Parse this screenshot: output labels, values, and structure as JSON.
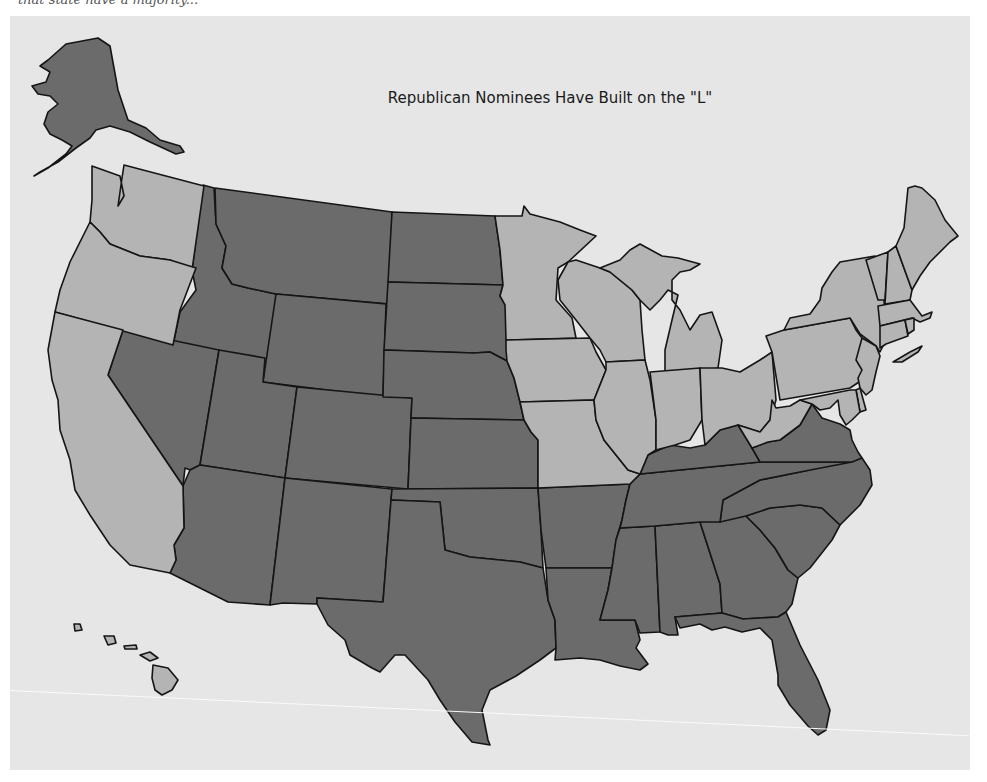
{
  "page": {
    "top_text": "that state have a majority..."
  },
  "map": {
    "title": "Republican Nominees Have Built on the \"L\"",
    "colors": {
      "background": "#e6e6e6",
      "republican_states": "#6b6b6b",
      "other_states": "#b4b4b4",
      "border": "#151515"
    },
    "legend": [],
    "dark_states": [
      "Alaska",
      "Idaho",
      "Montana",
      "Wyoming",
      "Nevada",
      "Utah",
      "Colorado",
      "Arizona",
      "New Mexico",
      "North Dakota",
      "South Dakota",
      "Nebraska",
      "Kansas",
      "Oklahoma",
      "Texas",
      "Arkansas",
      "Louisiana",
      "Mississippi",
      "Alabama",
      "Georgia",
      "Florida",
      "South Carolina",
      "North Carolina",
      "Tennessee",
      "Kentucky",
      "Virginia"
    ],
    "light_states": [
      "Hawaii",
      "Washington",
      "Oregon",
      "California",
      "Minnesota",
      "Iowa",
      "Missouri",
      "Wisconsin",
      "Illinois",
      "Michigan",
      "Indiana",
      "Ohio",
      "West Virginia",
      "Pennsylvania",
      "New York",
      "Vermont",
      "New Hampshire",
      "Maine",
      "Massachusetts",
      "Rhode Island",
      "Connecticut",
      "New Jersey",
      "Delaware",
      "Maryland"
    ]
  }
}
